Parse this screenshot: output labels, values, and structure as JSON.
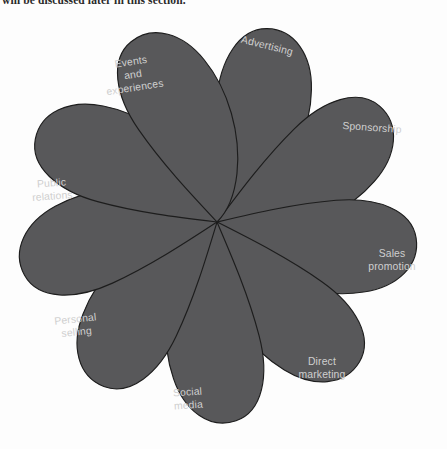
{
  "document": {
    "body_text_fragment": "will be discussed later in this section."
  },
  "figure": {
    "name": "marketing-communications-mix",
    "center": {
      "x": 217,
      "y": 214
    },
    "petal_fill": "#58585a",
    "petal_stroke": "#1d1d1d",
    "label_color": "#cfcfcf",
    "background": "#fdfdfd",
    "petal_count": 9,
    "petals": [
      {
        "id": "advertising",
        "label": "Advertising",
        "lines": [
          "Advertising"
        ],
        "angle_deg": -68,
        "label_x": 267,
        "label_y": 38,
        "label_rotate": 14
      },
      {
        "id": "sponsorship",
        "label": "Sponsorship",
        "lines": [
          "Sponsorship"
        ],
        "angle_deg": -28,
        "label_x": 372,
        "label_y": 120,
        "label_rotate": 4
      },
      {
        "id": "sales-promotion",
        "label": "Sales promotion",
        "lines": [
          "Sales",
          "promotion"
        ],
        "angle_deg": 12,
        "label_x": 392,
        "label_y": 252,
        "label_rotate": 0
      },
      {
        "id": "direct-marketing",
        "label": "Direct marketing",
        "lines": [
          "Direct",
          "marketing"
        ],
        "angle_deg": 52,
        "label_x": 322,
        "label_y": 360,
        "label_rotate": 0
      },
      {
        "id": "social-media",
        "label": "Social media",
        "lines": [
          "Social",
          "media"
        ],
        "angle_deg": 92,
        "label_x": 188,
        "label_y": 391,
        "label_rotate": -4
      },
      {
        "id": "personal-selling",
        "label": "Personal selling",
        "lines": [
          "Personal",
          "selling"
        ],
        "angle_deg": 132,
        "label_x": 76,
        "label_y": 318,
        "label_rotate": -6
      },
      {
        "id": "public-relations",
        "label": "Public relations",
        "lines": [
          "Public",
          "relations"
        ],
        "angle_deg": 172,
        "label_x": 52,
        "label_y": 182,
        "label_rotate": -4
      },
      {
        "id": "events-and-experiences",
        "label": "Events and experiences",
        "lines": [
          "Events",
          "and",
          "experiences"
        ],
        "angle_deg": 212,
        "label_x": 133,
        "label_y": 67,
        "label_rotate": -9
      },
      {
        "id": "unlabelled-petal",
        "label": "",
        "lines": [],
        "angle_deg": 252,
        "label_x": 0,
        "label_y": 0,
        "label_rotate": 0
      }
    ]
  }
}
